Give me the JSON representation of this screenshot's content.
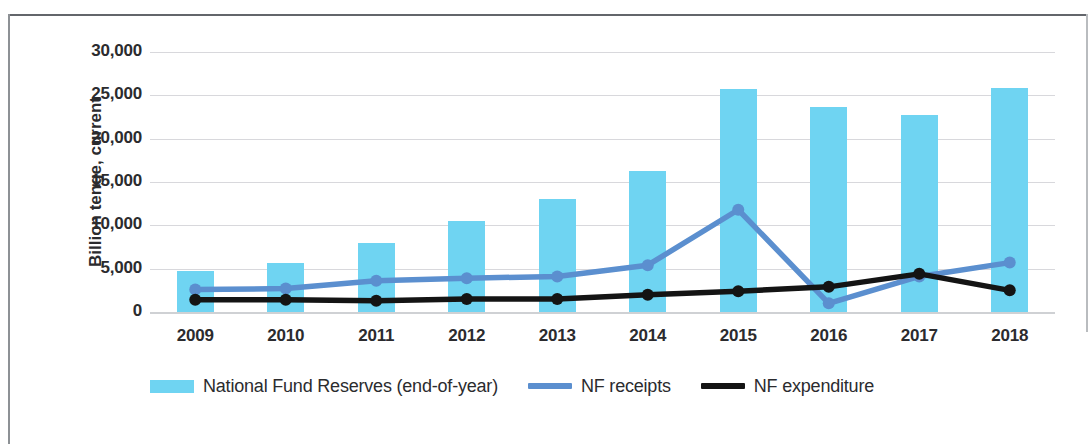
{
  "chart_data": {
    "type": "bar",
    "title": "",
    "subtitle": "",
    "xlabel": "",
    "ylabel": "Billion tenge, current",
    "categories": [
      "2009",
      "2010",
      "2011",
      "2012",
      "2013",
      "2014",
      "2015",
      "2016",
      "2017",
      "2018"
    ],
    "ylim": [
      0,
      30000
    ],
    "ytick_values": [
      0,
      5000,
      10000,
      15000,
      20000,
      25000,
      30000
    ],
    "ytick_labels": [
      "0",
      "5,000",
      "10,000",
      "15,000",
      "20,000",
      "25,000",
      "30,000"
    ],
    "grid": true,
    "legend_position": "bottom",
    "series": [
      {
        "name": "National Fund Reserves (end-of-year)",
        "type": "bar",
        "color": "#6FD4F2",
        "values": [
          4700,
          5700,
          8000,
          10500,
          13000,
          16300,
          25700,
          23700,
          22700,
          25900
        ]
      },
      {
        "name": "NF receipts",
        "type": "line",
        "color": "#5B8FCF",
        "values": [
          2600,
          2700,
          3600,
          3900,
          4100,
          5400,
          11800,
          1000,
          4100,
          5700
        ]
      },
      {
        "name": "NF expenditure",
        "type": "line",
        "color": "#141414",
        "values": [
          1400,
          1400,
          1300,
          1500,
          1500,
          2000,
          2400,
          2900,
          4400,
          2500
        ]
      }
    ]
  },
  "legend": {
    "items": [
      {
        "label": "National Fund Reserves (end-of-year)",
        "marker": "bar-swatch",
        "color": "#6FD4F2"
      },
      {
        "label": "NF receipts",
        "marker": "line-swatch",
        "color": "#5B8FCF"
      },
      {
        "label": "NF expenditure",
        "marker": "line-swatch",
        "color": "#141414"
      }
    ]
  }
}
